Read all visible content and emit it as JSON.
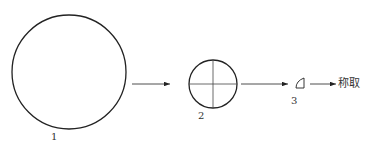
{
  "diagram": {
    "stages": [
      {
        "label": "1",
        "shape": "large-circle"
      },
      {
        "label": "2",
        "shape": "quartered-circle"
      },
      {
        "label": "3",
        "shape": "quarter-sector"
      }
    ],
    "final_step": "称取",
    "colors": {
      "stroke": "#222222",
      "background": "#ffffff"
    }
  }
}
